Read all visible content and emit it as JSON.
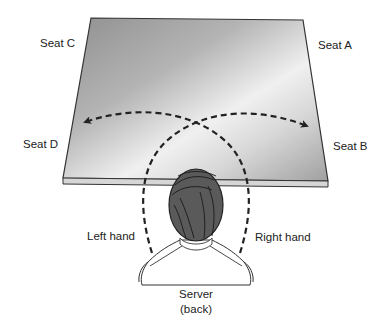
{
  "diagram": {
    "type": "table-service-reach",
    "seats": [
      {
        "id": "seat-c",
        "label": "Seat C"
      },
      {
        "id": "seat-a",
        "label": "Seat A"
      },
      {
        "id": "seat-d",
        "label": "Seat D"
      },
      {
        "id": "seat-b",
        "label": "Seat B"
      }
    ],
    "hands": {
      "left": "Left hand",
      "right": "Right hand"
    },
    "server": {
      "label": "Server",
      "sublabel": "(back)"
    },
    "colors": {
      "table_top_dark": "#9a9a9a",
      "table_top_light": "#f2f2f2",
      "table_edge": "#d6d6d6",
      "outline": "#333333",
      "hair": "#5a5a5a",
      "dashed_arc": "#222222",
      "text": "#222222"
    }
  }
}
